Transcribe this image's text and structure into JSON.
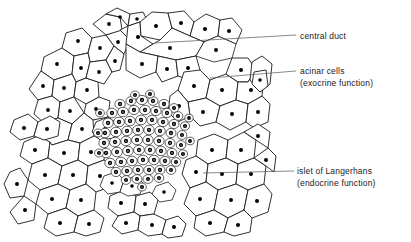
{
  "figure": {
    "background_color": "#ffffff",
    "ink_color": "#1a1a1a",
    "nucleus_color": "#000000",
    "leader_line_color": "#555555"
  },
  "labels": {
    "central_duct": {
      "text": "central duct",
      "leader_from": [
        155,
        43
      ],
      "leader_to": [
        296,
        35
      ]
    },
    "acinar_cells": {
      "line1": "acinar cells",
      "line2": "(exocrine function)",
      "leader_from": [
        210,
        78
      ],
      "leader_to": [
        296,
        71
      ]
    },
    "islet_of_langerhans": {
      "line1": "islet of Langerhans",
      "line2": "(endocrine function)",
      "leader_from": [
        203,
        173
      ],
      "leader_to": [
        294,
        171
      ]
    }
  },
  "structures": {
    "acinar_cells": {
      "name": "acinar cells",
      "description": "large irregular polygonal cells each with one dark round nucleus",
      "nucleus_style": "solid dot"
    },
    "islet": {
      "name": "islet of Langerhans",
      "description": "dense cluster of small rounded cells with ring-shaped nuclei",
      "center": [
        150,
        140
      ],
      "radius_x": 46,
      "radius_y": 45,
      "nucleus_style": "ring"
    },
    "central_duct": {
      "name": "central duct",
      "description": "duct lumen between acinar cells at upper centre"
    }
  }
}
